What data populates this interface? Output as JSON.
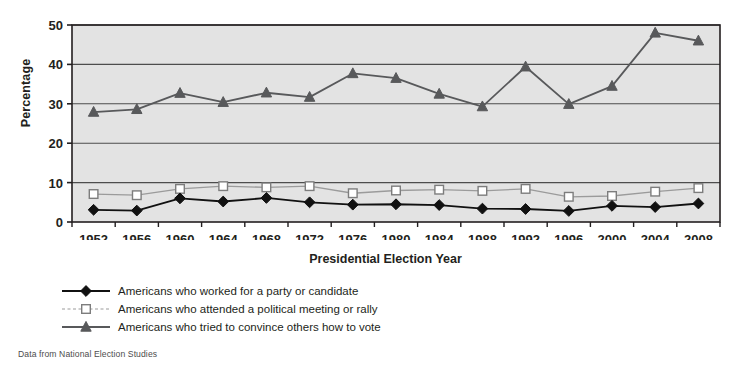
{
  "chart_data": {
    "type": "line",
    "title": "",
    "xlabel": "Presidential Election Year",
    "ylabel": "Percentage",
    "categories": [
      "1952",
      "1956",
      "1960",
      "1964",
      "1968",
      "1972",
      "1976",
      "1980",
      "1984",
      "1988",
      "1992",
      "1996",
      "2000",
      "2004",
      "2008"
    ],
    "x": [
      1952,
      1956,
      1960,
      1964,
      1968,
      1972,
      1976,
      1980,
      1984,
      1988,
      1992,
      1996,
      2000,
      2004,
      2008
    ],
    "ylim": [
      0,
      50
    ],
    "yticks": [
      0,
      10,
      20,
      30,
      40,
      50
    ],
    "grid": true,
    "legend_position": "below",
    "plot_background": "#e3e3e3",
    "series": [
      {
        "name": "Americans who worked for a party or candidate",
        "marker": "diamond-filled",
        "color": "#111111",
        "line_color": "#111111",
        "values": [
          3.1,
          2.9,
          6.0,
          5.2,
          6.1,
          5.0,
          4.4,
          4.5,
          4.3,
          3.4,
          3.3,
          2.8,
          4.1,
          3.8,
          4.7
        ]
      },
      {
        "name": "Americans who attended a political meeting or rally",
        "marker": "square-open",
        "color": "#9b9b9b",
        "line_color": "#9b9b9b",
        "values": [
          7.1,
          6.8,
          8.4,
          9.1,
          8.8,
          9.1,
          7.3,
          8.0,
          8.2,
          7.9,
          8.4,
          6.4,
          6.6,
          7.7,
          8.6
        ]
      },
      {
        "name": "Americans who tried to convince others how to vote",
        "marker": "triangle-filled",
        "color": "#58595b",
        "line_color": "#58595b",
        "values": [
          27.9,
          28.6,
          32.7,
          30.4,
          32.8,
          31.7,
          37.7,
          36.5,
          32.5,
          29.3,
          39.4,
          29.9,
          34.5,
          48.0,
          46.0
        ]
      }
    ]
  },
  "axes": {
    "y_title": "Percentage",
    "x_title": "Presidential Election Year"
  },
  "legend": {
    "items": [
      {
        "key": "diamond-filled-marker",
        "label": "Americans who worked for a party or candidate"
      },
      {
        "key": "square-open-marker",
        "label": "Americans who attended a political meeting or rally"
      },
      {
        "key": "triangle-filled-marker",
        "label": "Americans who tried to convince others how to vote"
      }
    ]
  },
  "source_note": "Data from National Election Studies"
}
